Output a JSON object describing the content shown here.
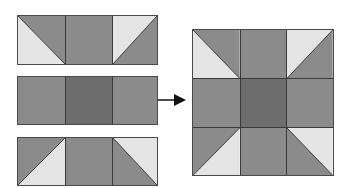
{
  "diagram": {
    "colors": {
      "medium": "#8b8b8b",
      "dark": "#6d6d6d",
      "light": "#e4e4e4",
      "seam": "#333333"
    },
    "rows": [
      {
        "name": "top-row",
        "cells": [
          "hst-light-bottom-left",
          "solid-medium",
          "hst-light-top-right"
        ]
      },
      {
        "name": "middle-row",
        "cells": [
          "solid-medium",
          "solid-dark",
          "solid-medium"
        ]
      },
      {
        "name": "bottom-row",
        "cells": [
          "hst-light-bottom-right",
          "solid-medium",
          "hst-light-top-right-mirror"
        ]
      }
    ],
    "arrow": {
      "direction": "right",
      "meaning": "sew rows together"
    },
    "result": {
      "name": "finished-nine-patch-block",
      "grid": "3x3"
    }
  }
}
